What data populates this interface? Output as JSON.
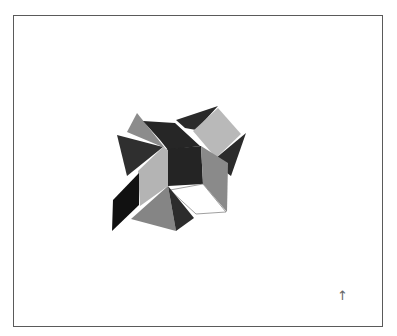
{
  "figure": {
    "frame": {
      "x": 13,
      "y": 15,
      "width": 370,
      "height": 312,
      "border_color": "#5a5a5a"
    },
    "object": {
      "name": "folded-polyhedron-model",
      "faces": [
        {
          "name": "top-left-light-triangle",
          "fill": "#8c8c8c",
          "points": "127,132 137,113 165,148"
        },
        {
          "name": "top-dark-band",
          "fill": "#262626",
          "points": "143,121 175,123 200,146 168,150 160,140"
        },
        {
          "name": "top-right-dark-triangle",
          "fill": "#2a2a2a",
          "points": "176,120 218,106 196,130 185,128"
        },
        {
          "name": "top-right-light-square",
          "fill": "#b9b9b9",
          "points": "193,131 218,108 241,134 216,158"
        },
        {
          "name": "right-dark-triangle",
          "fill": "#2b2b2b",
          "points": "216,158 246,133 231,176 218,166"
        },
        {
          "name": "top-left-dark-triangle",
          "fill": "#2f2f2f",
          "points": "117,135 163,147 127,176"
        },
        {
          "name": "center-dark-square",
          "fill": "#242424",
          "points": "167,149 201,146 203,184 168,186"
        },
        {
          "name": "right-gray-panel",
          "fill": "#8a8a8a",
          "points": "201,146 228,163 227,212 203,184"
        },
        {
          "name": "left-light-panel",
          "fill": "#b4b4b4",
          "points": "163,147 168,150 168,186 140,206 138,171"
        },
        {
          "name": "bottom-white-face",
          "fill": "#ffffff",
          "stroke": "#888888",
          "points": "170,190 203,184 226,212 196,214"
        },
        {
          "name": "left-black-parallelogram",
          "fill": "#111111",
          "points": "113,200 139,173 139,205 112,231"
        },
        {
          "name": "bottom-gray-pyramid-face",
          "fill": "#858585",
          "points": "131,219 168,186 176,231"
        },
        {
          "name": "bottom-dark-pyramid-face",
          "fill": "#2c2c2c",
          "points": "168,186 194,218 176,231"
        }
      ]
    },
    "north_arrow": {
      "glyph": "↑",
      "x": 337,
      "y": 289
    }
  }
}
